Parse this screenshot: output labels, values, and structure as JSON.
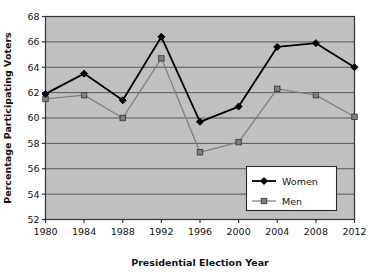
{
  "chart_data": {
    "type": "line",
    "title": "",
    "xlabel": "Presidential Election Year",
    "ylabel": "Percentage Participating Voters",
    "categories": [
      "1980",
      "1984",
      "1988",
      "1992",
      "1996",
      "2000",
      "2004",
      "2008",
      "2012"
    ],
    "xlim": [
      1980,
      2012
    ],
    "ylim": [
      52,
      68
    ],
    "yticks": [
      52,
      54,
      56,
      58,
      60,
      62,
      64,
      66,
      68
    ],
    "xticks": [
      "1980",
      "1984",
      "1988",
      "1992",
      "1996",
      "2000",
      "2004",
      "2008",
      "2012"
    ],
    "grid": "horizontal",
    "legend_position": "bottom-right",
    "plot_background": "#c0c0c0",
    "series": [
      {
        "name": "Women",
        "color": "#000000",
        "marker": "diamond",
        "values": [
          61.9,
          63.5,
          61.4,
          66.4,
          59.7,
          60.9,
          65.6,
          65.9,
          64.0
        ]
      },
      {
        "name": "Men",
        "color": "#808080",
        "marker": "square",
        "values": [
          61.5,
          61.8,
          60.0,
          64.7,
          57.3,
          58.1,
          62.3,
          61.8,
          60.1
        ]
      }
    ]
  },
  "legend": {
    "entries": [
      {
        "label": "Women"
      },
      {
        "label": "Men"
      }
    ]
  },
  "colors": {
    "women": "#000000",
    "men": "#808080",
    "plot_bg": "#c0c0c0",
    "gridline": "#595959",
    "axis": "#333333",
    "page_bg": "#ffffff"
  }
}
